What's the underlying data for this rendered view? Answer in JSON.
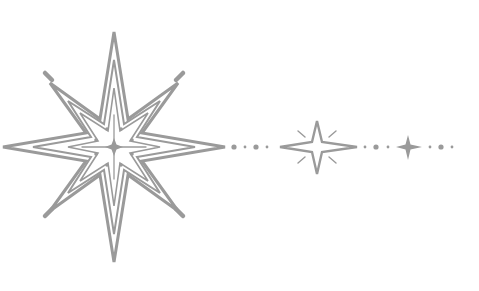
{
  "graphic": {
    "title": "Decorative star divider",
    "stroke_color": "#9a9a9a",
    "background": "#ffffff",
    "big_star": {
      "cx": 114,
      "cy": 147,
      "points": 8
    },
    "medium_star": {
      "cx": 317,
      "cy": 147,
      "points": 4
    },
    "small_star": {
      "cx": 408,
      "cy": 147,
      "points": 4
    }
  }
}
